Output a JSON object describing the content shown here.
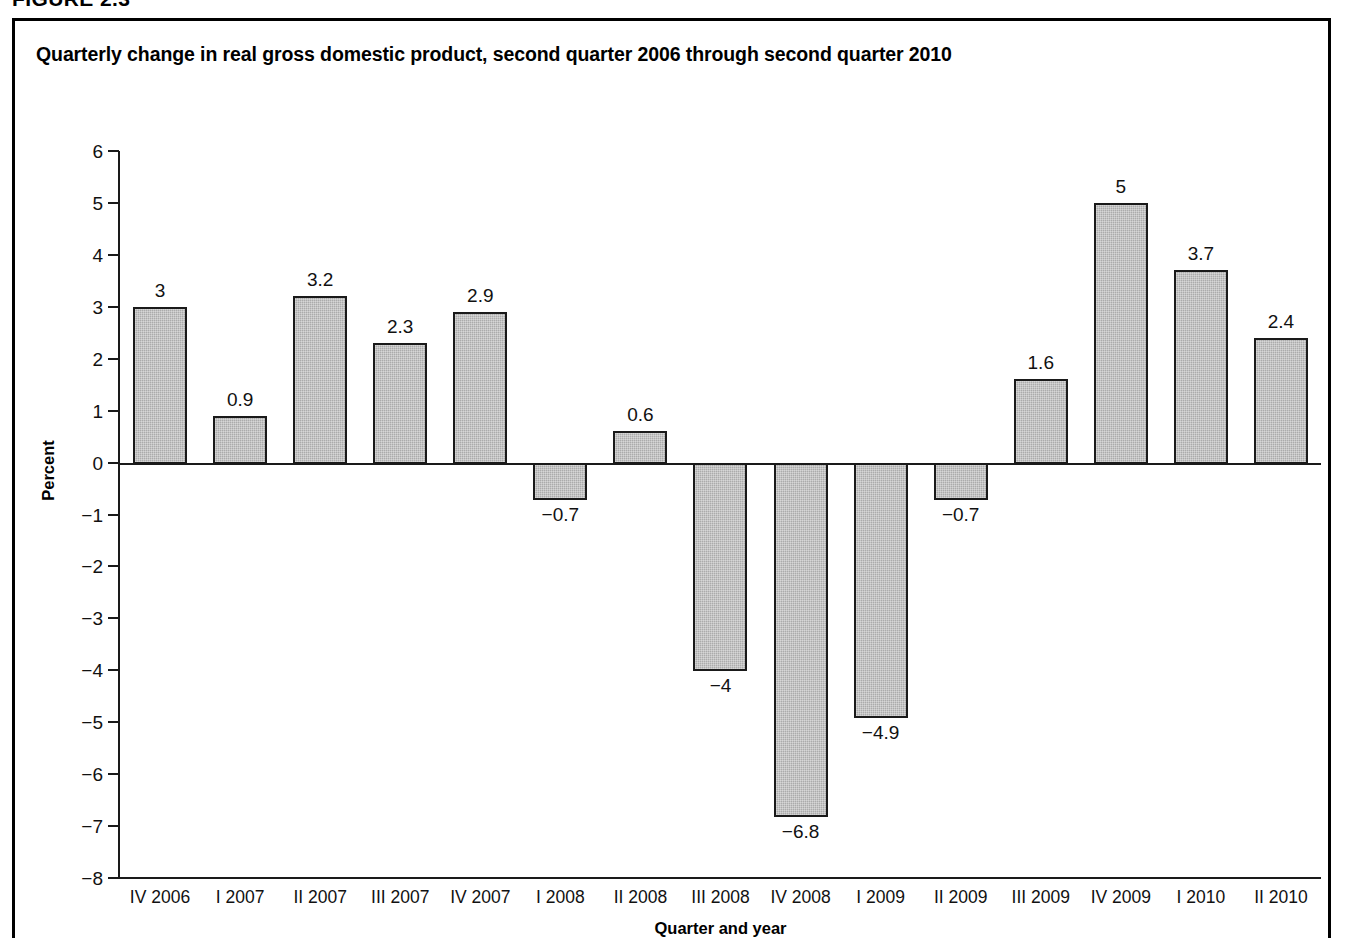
{
  "figure": {
    "number_label": "FIGURE 2.3",
    "title": "Quarterly change in real gross domestic product, second quarter 2006 through second quarter 2010"
  },
  "chart_data": {
    "type": "bar",
    "title": "Quarterly change in real gross domestic product, second quarter 2006 through second quarter 2010",
    "xlabel": "Quarter and year",
    "ylabel": "Percent",
    "ylim": [
      -8,
      6
    ],
    "ytick_labels": [
      "6",
      "5",
      "4",
      "3",
      "2",
      "1",
      "0",
      "−1",
      "−2",
      "−3",
      "−4",
      "−5",
      "−6",
      "−7",
      "−8"
    ],
    "ytick_values": [
      6,
      5,
      4,
      3,
      2,
      1,
      0,
      -1,
      -2,
      -3,
      -4,
      -5,
      -6,
      -7,
      -8
    ],
    "grid": false,
    "legend": null,
    "bar_fill_color": "#ababab",
    "bar_edge_color": "#1a1a1a",
    "categories": [
      "IV 2006",
      "I 2007",
      "II 2007",
      "III 2007",
      "IV 2007",
      "I 2008",
      "II 2008",
      "III 2008",
      "IV 2008",
      "I 2009",
      "II 2009",
      "III 2009",
      "IV 2009",
      "I 2010",
      "II 2010"
    ],
    "values": [
      3,
      0.9,
      3.2,
      2.3,
      2.9,
      -0.7,
      0.6,
      -4,
      -6.8,
      -4.9,
      -0.7,
      1.6,
      5,
      3.7,
      2.4
    ],
    "value_labels": [
      "3",
      "0.9",
      "3.2",
      "2.3",
      "2.9",
      "−0.7",
      "0.6",
      "−4",
      "−6.8",
      "−4.9",
      "−0.7",
      "1.6",
      "5",
      "3.7",
      "2.4"
    ]
  }
}
